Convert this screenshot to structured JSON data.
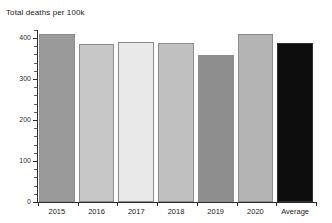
{
  "chart_data": {
    "type": "bar",
    "title": "Total deaths per 100k",
    "xlabel": "",
    "ylabel": "",
    "categories": [
      "2015",
      "2016",
      "2017",
      "2018",
      "2019",
      "2020",
      "Average"
    ],
    "values": [
      410,
      386,
      391,
      389,
      359,
      409,
      388
    ],
    "ylim": [
      0,
      430
    ],
    "yticks": [
      0,
      100,
      200,
      300,
      400
    ],
    "ytick_labels": [
      "0",
      "100",
      "200",
      "300",
      "400"
    ],
    "grid": false,
    "legend": "none",
    "bar_colors": [
      "#9a9a9a",
      "#c7c7c7",
      "#e9e9e9",
      "#c0c0c0",
      "#8e8e8e",
      "#b4b4b4",
      "#0d0d0d"
    ],
    "axis_color": "#2b2b2b",
    "background": "#ffffff"
  }
}
